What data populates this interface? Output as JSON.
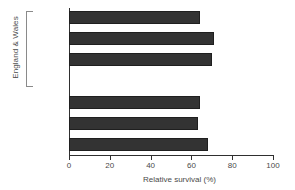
{
  "chart_data": {
    "type": "bar",
    "orientation": "horizontal",
    "title": "",
    "xlabel": "Relative survival (%)",
    "ylabel": "",
    "xlim": [
      0,
      100
    ],
    "xticks": [
      0,
      20,
      40,
      60,
      80,
      100
    ],
    "grid": false,
    "legend": null,
    "bar_color": "#333333",
    "categories": [
      "National\naverage",
      "Affluent",
      "Highest\nregion",
      "Scotland",
      "Europe",
      "USA"
    ],
    "values": [
      64,
      71,
      70,
      64,
      63,
      68
    ],
    "groups": [
      {
        "label": "England & Wales",
        "categories": [
          "National\naverage",
          "Affluent",
          "Highest\nregion"
        ]
      },
      {
        "label": "",
        "categories": [
          "Scotland",
          "Europe",
          "USA"
        ]
      }
    ],
    "bars": [
      {
        "label": "National\naverage",
        "value": 64,
        "group": "England & Wales",
        "top": 11
      },
      {
        "label": "Affluent",
        "value": 71,
        "group": "England & Wales",
        "top": 32
      },
      {
        "label": "Highest\nregion",
        "value": 70,
        "group": "England & Wales",
        "top": 53
      },
      {
        "label": "Scotland",
        "value": 64,
        "group": "",
        "top": 96
      },
      {
        "label": "Europe",
        "value": 63,
        "group": "",
        "top": 117
      },
      {
        "label": "USA",
        "value": 68,
        "group": "",
        "top": 138
      }
    ]
  },
  "axis": {
    "x_title": "Relative survival (%)",
    "tick_labels": [
      "0",
      "20",
      "40",
      "60",
      "80",
      "100"
    ]
  },
  "group_label": "England & Wales"
}
